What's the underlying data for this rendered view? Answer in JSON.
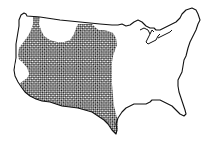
{
  "map": {
    "title": "Contiguous United States — shaded range (western half)",
    "colors": {
      "background": "#ffffff",
      "outline": "#111111",
      "hatch": "#1a1a1a"
    },
    "pattern": "checkerboard-crosshatch",
    "regions": [
      {
        "name": "shaded-range",
        "description": "Cross-hatched region covering western and south-central states from Pacific coast to central Texas"
      },
      {
        "name": "unshaded-northwest-gap",
        "description": "Unshaded area in northern Rockies (Idaho/Montana)"
      },
      {
        "name": "unshaded-california-sliver",
        "description": "Unshaded strip along central California coast"
      },
      {
        "name": "unshaded-east",
        "description": "Unshaded eastern United States"
      }
    ]
  }
}
